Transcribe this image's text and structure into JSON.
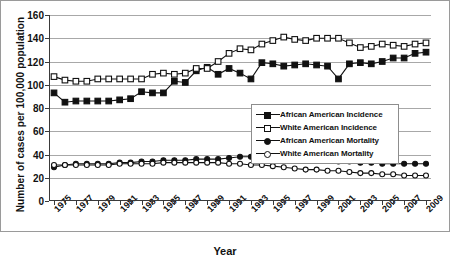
{
  "chart_data": {
    "type": "line",
    "title": "",
    "xlabel": "Year",
    "ylabel": "Number of cases per 100,000 population",
    "ylim": [
      0,
      160
    ],
    "ytick_step": 20,
    "yticks": [
      0,
      20,
      40,
      60,
      80,
      100,
      120,
      140,
      160
    ],
    "grid": true,
    "legend_position": "center-right",
    "x": [
      1975,
      1976,
      1977,
      1978,
      1979,
      1980,
      1981,
      1982,
      1983,
      1984,
      1985,
      1986,
      1987,
      1988,
      1989,
      1990,
      1991,
      1992,
      1993,
      1994,
      1995,
      1996,
      1997,
      1998,
      1999,
      2000,
      2001,
      2002,
      2003,
      2004,
      2005,
      2006,
      2007,
      2008,
      2009
    ],
    "xtick_labels": [
      "1975",
      "1977",
      "1979",
      "1981",
      "1983",
      "1985",
      "1987",
      "1989",
      "1991",
      "1993",
      "1995",
      "1997",
      "1999",
      "2001",
      "2003",
      "2005",
      "2007",
      "2009"
    ],
    "series": [
      {
        "name": "African American Incidence",
        "marker": "filled-square",
        "values": [
          93,
          85,
          86,
          86,
          86,
          86,
          87,
          88,
          94,
          93,
          93,
          103,
          102,
          112,
          115,
          109,
          114,
          110,
          105,
          119,
          118,
          116,
          117,
          118,
          117,
          116,
          105,
          118,
          119,
          118,
          120,
          123,
          123,
          127,
          128
        ]
      },
      {
        "name": "White American Incidence",
        "marker": "open-square",
        "values": [
          107,
          104,
          103,
          103,
          105,
          105,
          105,
          105,
          105,
          109,
          110,
          109,
          110,
          114,
          114,
          120,
          127,
          131,
          130,
          135,
          138,
          141,
          139,
          138,
          140,
          140,
          140,
          136,
          132,
          133,
          135,
          134,
          133,
          135,
          136
        ]
      },
      {
        "name": "African American Mortality",
        "marker": "filled-circle",
        "values": [
          29,
          31,
          32,
          32,
          32,
          32,
          33,
          33,
          34,
          34,
          35,
          35,
          35,
          36,
          36,
          36,
          37,
          38,
          38,
          38,
          37,
          37,
          36,
          36,
          35,
          35,
          34,
          34,
          33,
          33,
          32,
          32,
          32,
          32,
          32
        ]
      },
      {
        "name": "White American Mortality",
        "marker": "open-circle",
        "values": [
          31,
          31,
          31,
          31,
          31,
          31,
          32,
          32,
          32,
          32,
          33,
          33,
          33,
          33,
          33,
          33,
          32,
          32,
          31,
          31,
          30,
          29,
          28,
          27,
          27,
          26,
          26,
          25,
          24,
          24,
          23,
          23,
          22,
          22,
          22
        ]
      }
    ]
  },
  "legend": {
    "items": [
      {
        "label": "African American Incidence",
        "marker": "filled-square"
      },
      {
        "label": "White American Incidence",
        "marker": "open-square"
      },
      {
        "label": "African American Mortality",
        "marker": "filled-circle"
      },
      {
        "label": "White American Mortality",
        "marker": "open-circle"
      }
    ]
  },
  "axes": {
    "x_title": "Year",
    "y_title": "Number of cases per 100,000 population"
  },
  "colors": {
    "series": "#111111",
    "grid": "#a8a8a8",
    "axis": "#3a3a3a",
    "background": "#ffffff",
    "frame": "#9a9a9a"
  }
}
